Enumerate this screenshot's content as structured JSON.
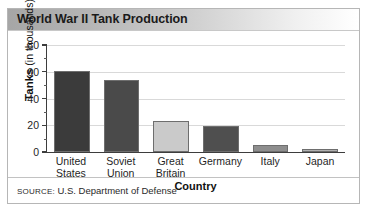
{
  "title": "World War II Tank Production",
  "source": {
    "label": "SOURCE:",
    "text": "U.S. Department of Defense",
    "full": "SOURCE: U.S. Department of Defense"
  },
  "yaxis": {
    "title_bold": "Tanks",
    "title_rest": " (in thousands)",
    "ticks": [
      "0",
      "20",
      "40",
      "60",
      "80"
    ]
  },
  "xaxis": {
    "title": "Country"
  },
  "chart_data": {
    "type": "bar",
    "title": "World War II Tank Production",
    "xlabel": "Country",
    "ylabel": "Tanks (in thousands)",
    "ylim": [
      0,
      80
    ],
    "yticks": [
      0,
      20,
      40,
      60,
      80
    ],
    "minor_tick_step": 10,
    "grid": true,
    "legend": false,
    "categories": [
      "United States",
      "Soviet Union",
      "Great Britain",
      "Germany",
      "Italy",
      "Japan"
    ],
    "category_lines": [
      [
        "United",
        "States"
      ],
      [
        "Soviet",
        "Union"
      ],
      [
        "Great",
        "Britain"
      ],
      [
        "Germany"
      ],
      [
        "Italy"
      ],
      [
        "Japan"
      ]
    ],
    "values": [
      60.5,
      54,
      23,
      19.5,
      5,
      2.5
    ],
    "bar_colors": [
      "#3b3b3b",
      "#4a4a4a",
      "#cacaca",
      "#4f4f4f",
      "#8e8e8e",
      "#b0b0b0"
    ],
    "units": "thousands of tanks"
  },
  "colors": {
    "banner_start": "#a6a6a6",
    "banner_end": "#ffffff",
    "axis": "#3d3d3d",
    "grid": "#d9d9d9",
    "frame_border": "#b6b6b6"
  }
}
